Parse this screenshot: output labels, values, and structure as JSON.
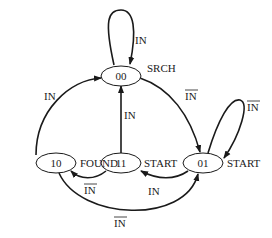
{
  "diagram": {
    "type": "state-machine",
    "states": [
      {
        "id": "00",
        "label": "00",
        "output": "SRCH"
      },
      {
        "id": "01",
        "label": "01",
        "output": "START"
      },
      {
        "id": "11",
        "label": "11",
        "output": "START"
      },
      {
        "id": "10",
        "label": "10",
        "output": "FOUND"
      }
    ],
    "transitions": [
      {
        "from": "00",
        "to": "00",
        "label": "IN",
        "negated": false
      },
      {
        "from": "00",
        "to": "01",
        "label": "IN",
        "negated": true
      },
      {
        "from": "01",
        "to": "01",
        "label": "IN",
        "negated": true
      },
      {
        "from": "01",
        "to": "11",
        "label": "IN",
        "negated": false
      },
      {
        "from": "11",
        "to": "00",
        "label": "IN",
        "negated": false
      },
      {
        "from": "11",
        "to": "10",
        "label": "IN",
        "negated": true
      },
      {
        "from": "10",
        "to": "00",
        "label": "IN",
        "negated": false
      },
      {
        "from": "10",
        "to": "01",
        "label": "IN",
        "negated": true
      }
    ],
    "colors": {
      "stroke": "#1a1a1a",
      "background": "#ffffff"
    }
  }
}
